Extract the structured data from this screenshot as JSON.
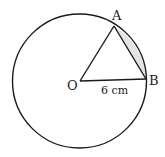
{
  "diagram": {
    "type": "geometry-circle-segment",
    "colors": {
      "stroke": "#1a1a1a",
      "shaded_segment": "#e4e4e4",
      "background": "#ffffff"
    },
    "points": {
      "O": {
        "label": "O"
      },
      "A": {
        "label": "A"
      },
      "B": {
        "label": "B"
      }
    },
    "radius_label": "6 cm",
    "shaded_region": "minor segment between chord AB and arc AB"
  }
}
